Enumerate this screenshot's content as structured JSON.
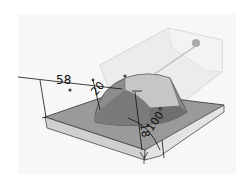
{
  "figure": {
    "type": "cad-model-view",
    "colors": {
      "background": "#ffffff",
      "plate_top": "#9a9a9a",
      "plate_side": "#cfcfcf",
      "boss_dark": "#6e6e6e",
      "boss_light": "#c4c4c4",
      "transparent_block": "#e6e6e6",
      "dimension_line": "#111111"
    },
    "dimensions": [
      {
        "id": "length",
        "label": "58"
      },
      {
        "id": "radius",
        "label": "20"
      },
      {
        "id": "height",
        "label": "18"
      },
      {
        "id": "angle",
        "label": "100°"
      }
    ]
  }
}
